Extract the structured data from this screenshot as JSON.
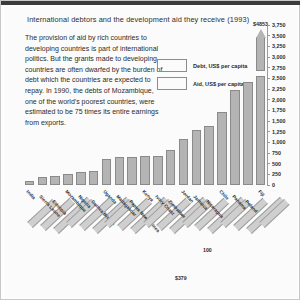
{
  "chart_data": {
    "type": "bar",
    "title": "International debtors and the development aid they receive (1993)",
    "xlabel": "",
    "ylabel": "",
    "ylim": [
      0,
      3750
    ],
    "grid": false,
    "legend_position": "upper-center",
    "axis_note": "top bar is broken / off-scale",
    "ytick_labels": [
      "3,750",
      "3,500",
      "3,250",
      "3,000",
      "2,750",
      "2,500",
      "2,250",
      "2,000",
      "1,750",
      "1,500",
      "1,250",
      "1,000",
      "750",
      "500",
      "250",
      "0"
    ],
    "ytick_values": [
      3750,
      3500,
      3250,
      3000,
      2750,
      2500,
      2250,
      2000,
      1750,
      1500,
      1250,
      1000,
      750,
      500,
      250,
      0
    ],
    "legend": [
      {
        "label": "Debt, US$ per capita",
        "color": "#b4b4b4"
      },
      {
        "label": "Aid, US$ per capita",
        "color": "#b4b4b4"
      }
    ],
    "categories": [
      "India",
      "Sierra Leone",
      "Ethiopia",
      "Mozambique",
      "Nigeria",
      "Guinea Bissau",
      "Uganda",
      "Madagascar",
      "Papua New Guinea",
      "Kenya",
      "Ivory Coast",
      "Zimbabwe",
      "Jordan",
      "Jamaica",
      "Nicaragua",
      "Chile",
      "Panama",
      "Poland",
      "Fiji"
    ],
    "series": [
      {
        "name": "Debt, US$ per capita",
        "values": [
          100,
          180,
          200,
          250,
          300,
          320,
          600,
          650,
          660,
          680,
          690,
          820,
          1080,
          1300,
          1380,
          1720,
          2220,
          2420,
          4853
        ]
      }
    ],
    "annotations": [
      {
        "text": "$4853",
        "value": 4853,
        "note": "peak bar label above broken bar tip"
      },
      {
        "text": "100",
        "value": 100,
        "note": "value callout"
      },
      {
        "text": "$379",
        "value": 379,
        "note": "value callout"
      }
    ]
  },
  "figure": {
    "title": "International debtors and the development aid they receive (1993)",
    "blurb": "The provision of aid by rich countries to developing countries is part of international politics. But the grants made to developing countries are often dwarfed by the burden of debt which the countries are expected to repay. In 1990, the debts of Mozambique, one of the world's poorest countries, were estimated to be 75 times its entire earnings from exports."
  },
  "colors": {
    "bar": "#b4b4b4",
    "bar_border": "#8a8a8a",
    "ink": "#2b2b2b",
    "rule": "#3b3b3b"
  }
}
